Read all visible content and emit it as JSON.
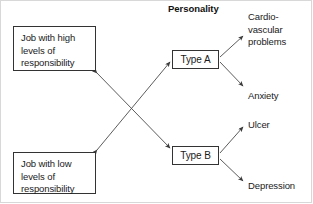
{
  "diagram": {
    "heading": "Personality",
    "job_nodes": [
      {
        "id": "job-high",
        "label": "Job with high levels of responsibility"
      },
      {
        "id": "job-low",
        "label": "Job with low levels of responsibility"
      }
    ],
    "personality_nodes": [
      {
        "id": "type-a",
        "label": "Type A"
      },
      {
        "id": "type-b",
        "label": "Type B"
      }
    ],
    "outcomes": [
      {
        "id": "outcome-cvd",
        "label": "Cardio-\nvascular\nproblems"
      },
      {
        "id": "outcome-anxiety",
        "label": "Anxiety"
      },
      {
        "id": "outcome-ulcer",
        "label": "Ulcer"
      },
      {
        "id": "outcome-depression",
        "label": "Depression"
      }
    ],
    "connections": [
      {
        "from": "job-high",
        "to": "type-b",
        "style": "double-headed"
      },
      {
        "from": "job-low",
        "to": "type-a",
        "style": "double-headed"
      },
      {
        "from": "type-a",
        "to": "outcome-cvd",
        "style": "single-headed"
      },
      {
        "from": "type-a",
        "to": "outcome-anxiety",
        "style": "single-headed"
      },
      {
        "from": "type-b",
        "to": "outcome-ulcer",
        "style": "single-headed"
      },
      {
        "from": "type-b",
        "to": "outcome-depression",
        "style": "single-headed"
      }
    ],
    "colors": {
      "line": "#4a4a4a",
      "box_border": "#333333",
      "text": "#1a1a1a",
      "background": "#ffffff"
    }
  }
}
